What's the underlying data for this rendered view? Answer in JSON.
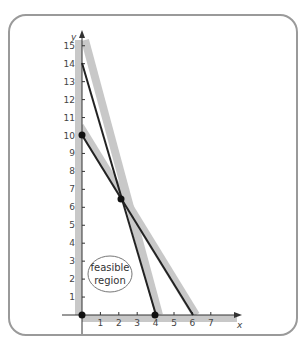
{
  "chart_data": {
    "type": "line",
    "title": "",
    "xlabel": "x",
    "ylabel": "y",
    "xlim": [
      0,
      7
    ],
    "ylim": [
      0,
      15
    ],
    "x_ticks": [
      1,
      2,
      3,
      4,
      5,
      6,
      7
    ],
    "y_ticks": [
      1,
      2,
      3,
      4,
      5,
      6,
      7,
      8,
      9,
      10,
      11,
      12,
      13,
      14,
      15
    ],
    "grid": false,
    "series": [
      {
        "name": "constraint line 1",
        "points": [
          [
            0,
            14
          ],
          [
            4,
            0
          ]
        ],
        "color": "#222222"
      },
      {
        "name": "constraint line 2",
        "points": [
          [
            0,
            10
          ],
          [
            6,
            0
          ]
        ],
        "color": "#222222"
      }
    ],
    "vertices": [
      {
        "x": 0,
        "y": 0
      },
      {
        "x": 0,
        "y": 10
      },
      {
        "x": 2.22,
        "y": 6.3
      },
      {
        "x": 4,
        "y": 0
      }
    ],
    "annotations": [
      {
        "text": "feasible region",
        "x": 1,
        "y": 2
      }
    ],
    "shading": "gray bands along the non-feasible side of each boundary line and axis"
  },
  "labels": {
    "x_axis": "x",
    "y_axis": "y",
    "region_line1": "feasible",
    "region_line2": "region",
    "x_ticks": [
      "1",
      "2",
      "3",
      "4",
      "5",
      "6",
      "7"
    ],
    "y_ticks": [
      "1",
      "2",
      "3",
      "4",
      "5",
      "6",
      "7",
      "8",
      "9",
      "10",
      "11",
      "12",
      "13",
      "14",
      "15"
    ]
  },
  "colors": {
    "line": "#222222",
    "band": "#c8c8c8",
    "axis": "#333333",
    "frame": "#9a9a9a",
    "point": "#111111"
  }
}
